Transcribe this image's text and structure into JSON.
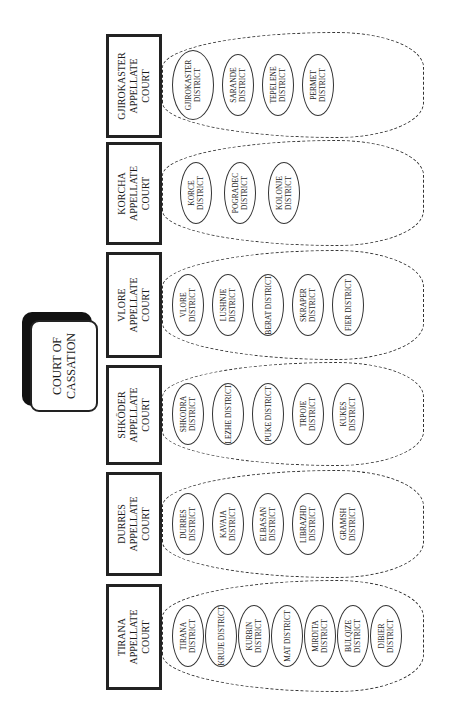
{
  "title": "COURT OF CASSATION",
  "colors": {
    "line": "#222222",
    "background": "#ffffff",
    "shadow": "#111111"
  },
  "courts": [
    {
      "name": "TIRANA APPELLATE COURT",
      "districts": [
        "TIRANA DISTRICT",
        "KRUJE DISTRICT",
        "KURBIN DISTRICT",
        "MAT DISTRICT",
        "MIRDITA DISTRICT",
        "BULQIZE DISTRICT",
        "DIBIER DISTRICT"
      ]
    },
    {
      "name": "DURRES APPELLATE COURT",
      "districts": [
        "DURRES DISTRICT",
        "KAVAJA DISTRICT",
        "ELBASAN DISTRICT",
        "LIBRAZHD DISTRICT",
        "GRAMSH DISTRICT"
      ]
    },
    {
      "name": "SHKÖDER APPELLATE COURT",
      "districts": [
        "SHKODRA DISTRICT",
        "LEZHE DISTRICT",
        "PUKE DISTRICT",
        "TRPOJE DISTRICT",
        "KUKES DISTRICT"
      ]
    },
    {
      "name": "VLORE APPELLATE COURT",
      "districts": [
        "VLORE DISTRICT",
        "LUSHNJE DISTRICT",
        "BERAT DISTRICT",
        "SKRAPER DISTRICT",
        "FIER DISTRICT"
      ]
    },
    {
      "name": "KORCHA APPELLATE COURT",
      "districts": [
        "KORCE DISTRICT",
        "POGRADEC DISTRICT",
        "KOLONJE DISTRICT"
      ]
    },
    {
      "name": "GJIROKASTER APPELLATE COURT",
      "districts": [
        "GJIROKASTER DISTRICT",
        "SARANDE DISTRICT",
        "TEPELENE DISTRICT",
        "PERMET DISTRICT"
      ]
    }
  ]
}
